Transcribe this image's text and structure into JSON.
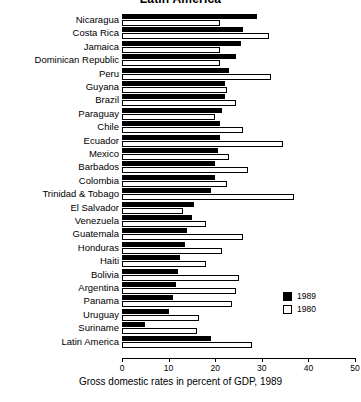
{
  "chart_data": {
    "type": "bar",
    "orientation": "horizontal",
    "title": "Latin America",
    "xlabel": "Gross domestic rates in percent of GDP, 1989",
    "ylabel": "",
    "xlim": [
      0,
      50
    ],
    "xticks": [
      0,
      10,
      20,
      30,
      40,
      50
    ],
    "xtick_labels": [
      "0",
      "10",
      "20",
      "30",
      "40",
      "50"
    ],
    "grid": false,
    "legend_position": "bottom-right",
    "categories": [
      "Nicaragua",
      "Costa Rica",
      "Jamaica",
      "Dominican Republic",
      "Peru",
      "Guyana",
      "Brazil",
      "Paraguay",
      "Chile",
      "Ecuador",
      "Mexico",
      "Barbados",
      "Colombia",
      "Trinidad & Tobago",
      "El Salvador",
      "Venezuela",
      "Guatemala",
      "Honduras",
      "Haiti",
      "Bolivia",
      "Argentina",
      "Panama",
      "Uruguay",
      "Suriname",
      "Latin America"
    ],
    "series": [
      {
        "name": "1989",
        "color": "#000000",
        "values": [
          29.0,
          26.0,
          25.5,
          24.5,
          23.0,
          22.0,
          22.0,
          21.5,
          21.0,
          21.0,
          20.5,
          20.0,
          20.0,
          19.0,
          15.5,
          15.0,
          14.0,
          13.5,
          12.5,
          12.0,
          11.5,
          11.0,
          10.0,
          5.0,
          19.0
        ]
      },
      {
        "name": "1980",
        "color": "#ffffff",
        "values": [
          21.0,
          31.5,
          21.0,
          21.0,
          32.0,
          22.5,
          24.5,
          20.0,
          26.0,
          34.5,
          23.0,
          27.0,
          22.5,
          37.0,
          13.0,
          18.0,
          26.0,
          21.5,
          18.0,
          25.0,
          24.5,
          23.5,
          16.5,
          16.0,
          28.0
        ]
      }
    ]
  },
  "legend": {
    "entries": [
      {
        "label": "1989",
        "style": "filled"
      },
      {
        "label": "1980",
        "style": "open"
      }
    ]
  }
}
